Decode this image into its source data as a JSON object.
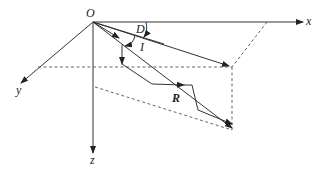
{
  "diagram": {
    "labels": {
      "origin": "O",
      "x_axis": "x",
      "y_axis": "y",
      "z_axis": "z",
      "declination": "D",
      "inclination": "I",
      "resultant": "R"
    },
    "colors": {
      "line": "#333333",
      "dashed": "#555555",
      "text": "#222222"
    }
  }
}
